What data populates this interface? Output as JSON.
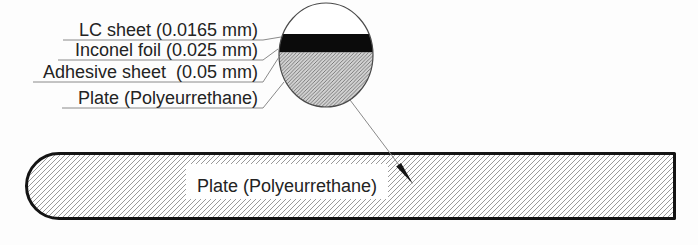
{
  "figure": {
    "title_hint": "Layered LC-coating cross-section diagram",
    "colors": {
      "background": "#fdfdfd",
      "plate_outline": "#141414",
      "leader_line": "#8a8a8a",
      "foil_black": "#0b0b0b",
      "detail_gray_fill": "#d2d2d2",
      "hatch_line": "#6e6e6e",
      "text": "#232323"
    },
    "detail": {
      "labels": [
        {
          "id": "lc-sheet",
          "text": "LC sheet (0.0165 mm)"
        },
        {
          "id": "inconel-foil",
          "text": "Inconel foil (0.025 mm)"
        },
        {
          "id": "adhesive-sheet",
          "text": "Adhesive sheet  (0.05 mm)"
        },
        {
          "id": "plate",
          "text": "Plate (Polyeurrethane)"
        }
      ]
    },
    "plate": {
      "label": "Plate (Polyeurrethane)"
    }
  }
}
